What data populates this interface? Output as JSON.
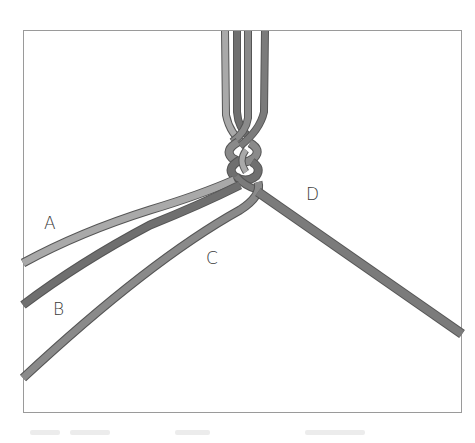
{
  "figure": {
    "type": "macrame-braid-illustration",
    "frame": {
      "x": 23,
      "y": 30,
      "width": 439,
      "height": 383,
      "stroke": "#9a9a9a"
    },
    "labels": {
      "a": "A",
      "b": "B",
      "c": "C",
      "d": "D"
    },
    "colors": {
      "cord_a": "#a9a9a9",
      "cord_b": "#6f6f6f",
      "cord_c": "#8a8a8a",
      "cord_d": "#7b7b7b",
      "outline": "#555555"
    }
  }
}
